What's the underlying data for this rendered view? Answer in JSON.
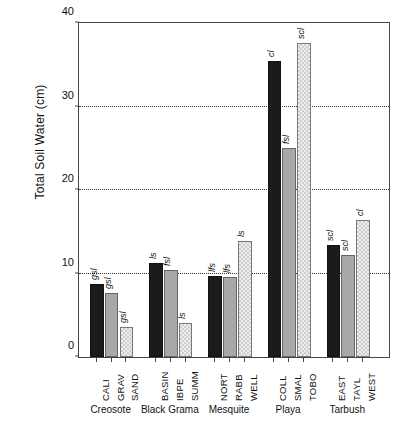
{
  "chart_data": {
    "type": "bar",
    "title": "",
    "xlabel": "",
    "ylabel": "Total Soil Water (cm)",
    "ylim": [
      0,
      40
    ],
    "yticks": [
      0,
      10,
      20,
      30,
      40
    ],
    "ytick_labels": [
      "0",
      "10",
      "20",
      "30",
      "40"
    ],
    "grid": true,
    "gridlines_at": [
      10,
      20,
      30
    ],
    "legend": "none",
    "categories": [
      "CALI",
      "GRAV",
      "SAND",
      "BASIN",
      "IBPE",
      "SUMM",
      "NORT",
      "RABB",
      "WELL",
      "COLL",
      "SMAL",
      "TOBO",
      "EAST",
      "TAYL",
      "WEST"
    ],
    "values": [
      8.7,
      7.6,
      3.6,
      11.2,
      10.3,
      4.1,
      9.7,
      9.5,
      13.8,
      35.2,
      24.9,
      37.4,
      13.3,
      12.1,
      16.3
    ],
    "point_labels": [
      "gsl",
      "gsl",
      "gsl",
      "ls",
      "fsl",
      "ls",
      "lfs",
      "lfs",
      "ls",
      "cl",
      "fsl",
      "scl",
      "scl",
      "scl",
      "cl"
    ],
    "groups": [
      {
        "name": "Creosote",
        "sites": [
          {
            "site": "CALI",
            "value": 8.7,
            "soil": "gsl",
            "fill": "black"
          },
          {
            "site": "GRAV",
            "value": 7.6,
            "soil": "gsl",
            "fill": "gray"
          },
          {
            "site": "SAND",
            "value": 3.6,
            "soil": "gsl",
            "fill": "hatched"
          }
        ]
      },
      {
        "name": "Black Grama",
        "sites": [
          {
            "site": "BASIN",
            "value": 11.2,
            "soil": "ls",
            "fill": "black"
          },
          {
            "site": "IBPE",
            "value": 10.3,
            "soil": "fsl",
            "fill": "gray"
          },
          {
            "site": "SUMM",
            "value": 4.1,
            "soil": "ls",
            "fill": "hatched"
          }
        ]
      },
      {
        "name": "Mesquite",
        "sites": [
          {
            "site": "NORT",
            "value": 9.7,
            "soil": "lfs",
            "fill": "black"
          },
          {
            "site": "RABB",
            "value": 9.5,
            "soil": "lfs",
            "fill": "gray"
          },
          {
            "site": "WELL",
            "value": 13.8,
            "soil": "ls",
            "fill": "hatched"
          }
        ]
      },
      {
        "name": "Playa",
        "sites": [
          {
            "site": "COLL",
            "value": 35.2,
            "soil": "cl",
            "fill": "black"
          },
          {
            "site": "SMAL",
            "value": 24.9,
            "soil": "fsl",
            "fill": "gray"
          },
          {
            "site": "TOBO",
            "value": 37.4,
            "soil": "scl",
            "fill": "hatched"
          }
        ]
      },
      {
        "name": "Tarbush",
        "sites": [
          {
            "site": "EAST",
            "value": 13.3,
            "soil": "scl",
            "fill": "black"
          },
          {
            "site": "TAYL",
            "value": 12.1,
            "soil": "scl",
            "fill": "gray"
          },
          {
            "site": "WEST",
            "value": 16.3,
            "soil": "cl",
            "fill": "hatched"
          }
        ]
      }
    ],
    "colors": {
      "series_black": "#1b1b1b",
      "series_gray": "#a8a8a8",
      "series_hatched": "#ededed",
      "axis": "#444444",
      "grid": "#333333"
    }
  }
}
